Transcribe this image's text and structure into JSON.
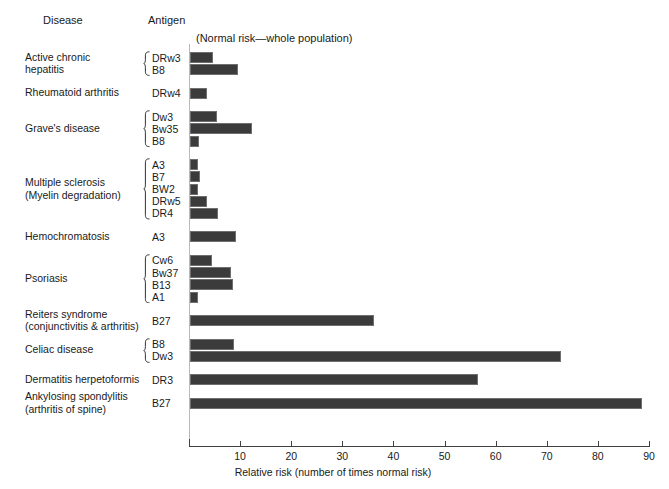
{
  "header": {
    "disease_col": "Disease",
    "antigen_col": "Antigen",
    "normal_note": "(Normal risk—whole population)"
  },
  "axis": {
    "title": "Relative risk (number of times normal risk)",
    "ticks": [
      "10",
      "20",
      "30",
      "40",
      "50",
      "60",
      "70",
      "80",
      "90"
    ]
  },
  "colors": {
    "bar_fill": "#3b3b3b",
    "bar_edge": "#6f6f6f",
    "axis": "#404040",
    "zero_line": "#b9b9b9",
    "text": "#1a1a1a",
    "background": "#ffffff"
  },
  "groups": [
    {
      "disease": "Active chronic\nhepatitis",
      "disease_line1": "Active chronic",
      "disease_line2": "hepatitis",
      "antigens": [
        "DRw3",
        "B8"
      ],
      "values": [
        4.5,
        9.4
      ]
    },
    {
      "disease": "Rheumatoid arthritis",
      "disease_line1": "Rheumatoid arthritis",
      "disease_line2": "",
      "antigens": [
        "DRw4"
      ],
      "values": [
        3.3
      ]
    },
    {
      "disease": "Grave's disease",
      "disease_line1": "Grave's disease",
      "disease_line2": "",
      "antigens": [
        "Dw3",
        "Bw35",
        "B8"
      ],
      "values": [
        5.3,
        12.2,
        1.8
      ]
    },
    {
      "disease": "Multiple sclerosis\n(Myelin degradation)",
      "disease_line1": "Multiple sclerosis",
      "disease_line2": "(Myelin degradation)",
      "antigens": [
        "A3",
        "B7",
        "BW2",
        "DRw5",
        "DR4"
      ],
      "values": [
        1.5,
        2.0,
        1.6,
        3.4,
        5.4
      ]
    },
    {
      "disease": "Hemochromatosis",
      "disease_line1": "Hemochromatosis",
      "disease_line2": "",
      "antigens": [
        "A3"
      ],
      "values": [
        9.0
      ]
    },
    {
      "disease": "Psoriasis",
      "disease_line1": "Psoriasis",
      "disease_line2": "",
      "antigens": [
        "Cw6",
        "Bw37",
        "B13",
        "A1"
      ],
      "values": [
        4.3,
        8.1,
        8.5,
        1.5
      ]
    },
    {
      "disease": "Reiters syndrome\n(conjunctivitis & arthritis)",
      "disease_line1": "Reiters syndrome",
      "disease_line2": "(conjunctivitis & arthritis)",
      "antigens": [
        "B27"
      ],
      "values": [
        36.0
      ]
    },
    {
      "disease": "Celiac disease",
      "disease_line1": "Celiac disease",
      "disease_line2": "",
      "antigens": [
        "B8",
        "Dw3"
      ],
      "values": [
        8.7,
        72.5
      ]
    },
    {
      "disease": "Dermatitis herpetoformis",
      "disease_line1": "Dermatitis herpetoformis",
      "disease_line2": "",
      "antigens": [
        "DR3"
      ],
      "values": [
        56.4
      ]
    },
    {
      "disease": "Ankylosing spondylitis\n(arthritis of spine)",
      "disease_line1": "Ankylosing spondylitis",
      "disease_line2": "(arthritis of spine)",
      "antigens": [
        "B27"
      ],
      "values": [
        88.4
      ]
    }
  ],
  "chart_data": {
    "type": "bar",
    "orientation": "horizontal",
    "title": "",
    "xlabel": "Relative risk (number of times normal risk)",
    "ylabel": "",
    "xlim": [
      0,
      90
    ],
    "xticks": [
      10,
      20,
      30,
      40,
      50,
      60,
      70,
      80,
      90
    ],
    "grid": false,
    "legend": null,
    "annotations": [
      "(Normal risk—whole population)"
    ],
    "column_headers": [
      "Disease",
      "Antigen"
    ],
    "categories": [
      "Active chronic hepatitis — DRw3",
      "Active chronic hepatitis — B8",
      "Rheumatoid arthritis — DRw4",
      "Grave's disease — Dw3",
      "Grave's disease — Bw35",
      "Grave's disease — B8",
      "Multiple sclerosis (Myelin degradation) — A3",
      "Multiple sclerosis (Myelin degradation) — B7",
      "Multiple sclerosis (Myelin degradation) — BW2",
      "Multiple sclerosis (Myelin degradation) — DRw5",
      "Multiple sclerosis (Myelin degradation) — DR4",
      "Hemochromatosis — A3",
      "Psoriasis — Cw6",
      "Psoriasis — Bw37",
      "Psoriasis — B13",
      "Psoriasis — A1",
      "Reiters syndrome (conjunctivitis & arthritis) — B27",
      "Celiac disease — B8",
      "Celiac disease — Dw3",
      "Dermatitis herpetoformis — DR3",
      "Ankylosing spondylitis (arthritis of spine) — B27"
    ],
    "values": [
      4.5,
      9.4,
      3.3,
      5.3,
      12.2,
      1.8,
      1.5,
      2.0,
      1.6,
      3.4,
      5.4,
      9.0,
      4.3,
      8.1,
      8.5,
      1.5,
      36.0,
      8.7,
      72.5,
      56.4,
      88.4
    ]
  }
}
